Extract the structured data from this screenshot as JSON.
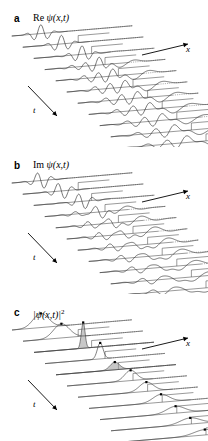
{
  "figure": {
    "background": "#ffffff",
    "stroke_color": "#2b2b2b",
    "baseline_color": "#555555",
    "fill_color": "#9a9a9a",
    "marker_color": "#000000"
  },
  "panels": [
    {
      "letter": "a",
      "title_prefix": "Re ",
      "title_psi": "ψ(x,t)",
      "title_sup": "",
      "type": "real-part",
      "x_axis_label": "x",
      "t_axis_label": "t"
    },
    {
      "letter": "b",
      "title_prefix": "Im ",
      "title_psi": "ψ(x,t)",
      "title_sup": "",
      "type": "imaginary-part",
      "x_axis_label": "x",
      "t_axis_label": "t"
    },
    {
      "letter": "c",
      "title_prefix": "",
      "title_psi": "|ψ(x,t)|",
      "title_sup": "2",
      "type": "probability-density",
      "x_axis_label": "x",
      "t_axis_label": "t"
    }
  ],
  "chart_data": {
    "type": "line",
    "xlabel": "x",
    "ylabel": "t",
    "legend": [],
    "grid": false,
    "n_traces_per_panel": 11,
    "trace_row_spacing_px": 11.2,
    "trace_row_x_shift_px": 11.0,
    "baseline_slope_dy_per_dx": -0.085,
    "series": [
      {
        "name": "Re psi(x,t)",
        "panel": "a",
        "description": "Oscillatory real part of the wave function; a carrier-modulated Gaussian packet moves to larger x with time, partially reflects and partially transmits at a step, and spreads.",
        "traces": [
          {
            "t_index": 0,
            "packet_center_x": 0.24,
            "packet_width": 0.085,
            "amplitude": 1.0,
            "carrier_k": 52,
            "reflected_amplitude": 0.0,
            "transmitted_amplitude": 0.0,
            "step_x": null
          },
          {
            "t_index": 1,
            "packet_center_x": 0.32,
            "packet_width": 0.088,
            "amplitude": 0.98,
            "carrier_k": 52,
            "reflected_amplitude": 0.0,
            "transmitted_amplitude": 0.0,
            "step_x": 0.46
          },
          {
            "t_index": 2,
            "packet_center_x": 0.4,
            "packet_width": 0.09,
            "amplitude": 0.95,
            "carrier_k": 52,
            "reflected_amplitude": 0.05,
            "transmitted_amplitude": 0.05,
            "step_x": 0.48
          },
          {
            "t_index": 3,
            "packet_center_x": 0.45,
            "packet_width": 0.095,
            "amplitude": 0.78,
            "carrier_k": 50,
            "reflected_amplitude": 0.3,
            "transmitted_amplitude": 0.45,
            "step_x": 0.5
          },
          {
            "t_index": 4,
            "packet_center_x": 0.47,
            "packet_width": 0.1,
            "amplitude": 0.62,
            "carrier_k": 48,
            "reflected_amplitude": 0.45,
            "transmitted_amplitude": 0.58,
            "step_x": 0.52
          },
          {
            "t_index": 5,
            "packet_center_x": 0.48,
            "packet_width": 0.108,
            "amplitude": 0.52,
            "carrier_k": 46,
            "reflected_amplitude": 0.5,
            "transmitted_amplitude": 0.62,
            "step_x": 0.55
          },
          {
            "t_index": 6,
            "packet_center_x": 0.49,
            "packet_width": 0.115,
            "amplitude": 0.46,
            "carrier_k": 44,
            "reflected_amplitude": 0.5,
            "transmitted_amplitude": 0.64,
            "step_x": 0.58
          },
          {
            "t_index": 7,
            "packet_center_x": 0.5,
            "packet_width": 0.122,
            "amplitude": 0.42,
            "carrier_k": 42,
            "reflected_amplitude": 0.48,
            "transmitted_amplitude": 0.64,
            "step_x": 0.61
          },
          {
            "t_index": 8,
            "packet_center_x": 0.51,
            "packet_width": 0.13,
            "amplitude": 0.39,
            "carrier_k": 40,
            "reflected_amplitude": 0.46,
            "transmitted_amplitude": 0.62,
            "step_x": 0.64
          },
          {
            "t_index": 9,
            "packet_center_x": 0.52,
            "packet_width": 0.138,
            "amplitude": 0.36,
            "carrier_k": 38,
            "reflected_amplitude": 0.44,
            "transmitted_amplitude": 0.6,
            "step_x": 0.67
          },
          {
            "t_index": 10,
            "packet_center_x": 0.53,
            "packet_width": 0.146,
            "amplitude": 0.34,
            "carrier_k": 36,
            "reflected_amplitude": 0.42,
            "transmitted_amplitude": 0.58,
            "step_x": 0.7
          }
        ]
      },
      {
        "name": "Im psi(x,t)",
        "panel": "b",
        "description": "Imaginary part of the same wave function; identical envelope to the real part but the carrier oscillation is shifted by a quarter period.",
        "carrier_phase_offset": 1.5708,
        "traces": [
          {
            "t_index": 0,
            "packet_center_x": 0.24,
            "packet_width": 0.085,
            "amplitude": 1.0,
            "carrier_k": 52,
            "reflected_amplitude": 0.0,
            "transmitted_amplitude": 0.0,
            "step_x": null
          },
          {
            "t_index": 1,
            "packet_center_x": 0.32,
            "packet_width": 0.088,
            "amplitude": 0.98,
            "carrier_k": 52,
            "reflected_amplitude": 0.0,
            "transmitted_amplitude": 0.0,
            "step_x": 0.46
          },
          {
            "t_index": 2,
            "packet_center_x": 0.4,
            "packet_width": 0.09,
            "amplitude": 0.95,
            "carrier_k": 52,
            "reflected_amplitude": 0.05,
            "transmitted_amplitude": 0.05,
            "step_x": 0.48
          },
          {
            "t_index": 3,
            "packet_center_x": 0.45,
            "packet_width": 0.095,
            "amplitude": 0.78,
            "carrier_k": 50,
            "reflected_amplitude": 0.3,
            "transmitted_amplitude": 0.45,
            "step_x": 0.5
          },
          {
            "t_index": 4,
            "packet_center_x": 0.47,
            "packet_width": 0.1,
            "amplitude": 0.62,
            "carrier_k": 48,
            "reflected_amplitude": 0.45,
            "transmitted_amplitude": 0.58,
            "step_x": 0.52
          },
          {
            "t_index": 5,
            "packet_center_x": 0.48,
            "packet_width": 0.108,
            "amplitude": 0.52,
            "carrier_k": 46,
            "reflected_amplitude": 0.5,
            "transmitted_amplitude": 0.62,
            "step_x": 0.55
          },
          {
            "t_index": 6,
            "packet_center_x": 0.49,
            "packet_width": 0.115,
            "amplitude": 0.46,
            "carrier_k": 44,
            "reflected_amplitude": 0.5,
            "transmitted_amplitude": 0.64,
            "step_x": 0.58
          },
          {
            "t_index": 7,
            "packet_center_x": 0.5,
            "packet_width": 0.122,
            "amplitude": 0.42,
            "carrier_k": 42,
            "reflected_amplitude": 0.48,
            "transmitted_amplitude": 0.64,
            "step_x": 0.61
          },
          {
            "t_index": 8,
            "packet_center_x": 0.51,
            "packet_width": 0.13,
            "amplitude": 0.39,
            "carrier_k": 40,
            "reflected_amplitude": 0.46,
            "transmitted_amplitude": 0.62,
            "step_x": 0.64
          },
          {
            "t_index": 9,
            "packet_center_x": 0.52,
            "packet_width": 0.138,
            "amplitude": 0.36,
            "carrier_k": 38,
            "reflected_amplitude": 0.44,
            "transmitted_amplitude": 0.6,
            "step_x": 0.67
          },
          {
            "t_index": 10,
            "packet_center_x": 0.53,
            "packet_width": 0.146,
            "amplitude": 0.34,
            "carrier_k": 36,
            "reflected_amplitude": 0.42,
            "transmitted_amplitude": 0.58,
            "step_x": 0.7
          }
        ]
      },
      {
        "name": "|psi(x,t)|^2",
        "panel": "c",
        "description": "Probability density; smooth bell-shaped humps whose peaks are marked with black dots. A tall narrow grey-filled spike appears at the focusing/collision time, after which the density broadens and flattens.",
        "traces": [
          {
            "t_index": 0,
            "peak_x": 0.24,
            "peak_height": 0.55,
            "width": 0.09,
            "marker": true,
            "filled": false,
            "step_x": null
          },
          {
            "t_index": 1,
            "peak_x": 0.32,
            "peak_height": 0.55,
            "width": 0.092,
            "marker": true,
            "filled": false,
            "step_x": 0.46
          },
          {
            "t_index": 2,
            "peak_x": 0.41,
            "peak_height": 1.0,
            "width": 0.022,
            "marker": true,
            "filled": true,
            "step_x": 0.48
          },
          {
            "t_index": 3,
            "peak_x": 0.46,
            "peak_height": 0.62,
            "width": 0.034,
            "marker": true,
            "filled": false,
            "step_x": 0.5
          },
          {
            "t_index": 4,
            "peak_x": 0.49,
            "peak_height": 0.3,
            "width": 0.055,
            "marker": true,
            "filled": true,
            "step_x": 0.52
          },
          {
            "t_index": 5,
            "peak_x": 0.53,
            "peak_height": 0.4,
            "width": 0.07,
            "marker": true,
            "filled": false,
            "step_x": 0.55
          },
          {
            "t_index": 6,
            "peak_x": 0.57,
            "peak_height": 0.36,
            "width": 0.082,
            "marker": true,
            "filled": false,
            "step_x": 0.58
          },
          {
            "t_index": 7,
            "peak_x": 0.6,
            "peak_height": 0.31,
            "width": 0.094,
            "marker": true,
            "filled": false,
            "step_x": 0.61
          },
          {
            "t_index": 8,
            "peak_x": 0.63,
            "peak_height": 0.27,
            "width": 0.105,
            "marker": true,
            "filled": false,
            "step_x": 0.64
          },
          {
            "t_index": 9,
            "peak_x": 0.66,
            "peak_height": 0.24,
            "width": 0.116,
            "marker": true,
            "filled": false,
            "step_x": 0.67
          },
          {
            "t_index": 10,
            "peak_x": 0.69,
            "peak_height": 0.21,
            "width": 0.126,
            "marker": true,
            "filled": false,
            "step_x": 0.7
          }
        ]
      }
    ]
  }
}
